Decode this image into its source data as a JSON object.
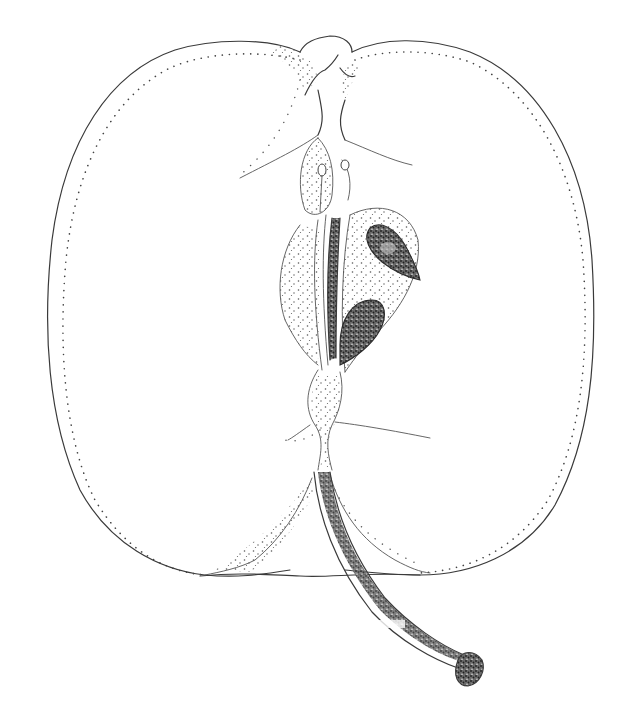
{
  "image": {
    "subject": "Longitudinal section of an apple",
    "style": "botanical pen-and-ink stipple drawing",
    "background": "#ffffff",
    "ink_color": "#3a3a3a",
    "parts": [
      {
        "name": "skin-outline",
        "label": "Skin outline"
      },
      {
        "name": "vascular-bundle-dots",
        "label": "Dotted vascular bundle line"
      },
      {
        "name": "calyx",
        "label": "Calyx (top)"
      },
      {
        "name": "core",
        "label": "Core / carpels"
      },
      {
        "name": "seed-upper",
        "label": "Upper seed"
      },
      {
        "name": "seed-lower",
        "label": "Lower seed"
      },
      {
        "name": "stem",
        "label": "Stem (pedicel)"
      }
    ]
  }
}
